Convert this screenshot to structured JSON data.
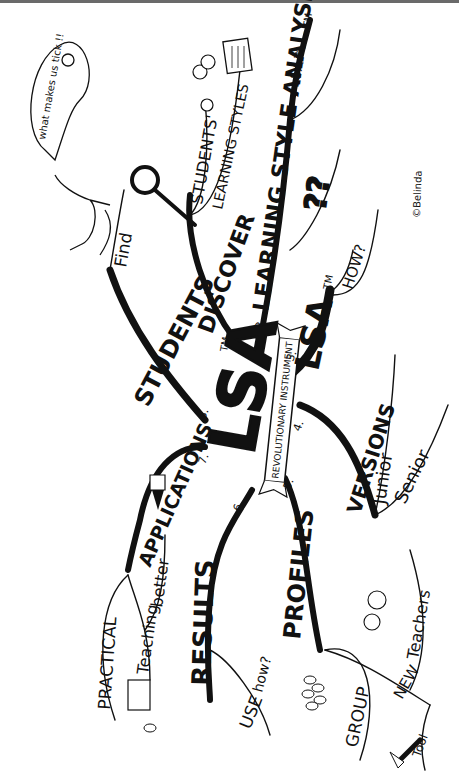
{
  "title": "LSA",
  "center": {
    "main_text": "LSA",
    "tm": "TM",
    "banner": "REVOLUTIONARY INSTRUMENT"
  },
  "branches": [
    {
      "number": "1.",
      "label": "DISCOVER",
      "children": [
        "STUDENTS'",
        "LEARNING STYLES"
      ]
    },
    {
      "number": "2.",
      "label": "LEARNING STYLE ANALYSIS",
      "tm": "TM",
      "children": [
        "LSA™",
        "??"
      ]
    },
    {
      "number": "3.",
      "label": "LSA",
      "tm": "TM",
      "children": [
        "HOW?"
      ]
    },
    {
      "number": "4.",
      "label": "VERSIONS",
      "children": [
        "Junior",
        "Senior"
      ]
    },
    {
      "number": "5.",
      "label": "PROFILES",
      "children": [
        "GROUP",
        "NEW",
        "Teachers",
        "Tool"
      ]
    },
    {
      "number": "6.",
      "label": "RESULTS",
      "children": [
        "USE",
        "how?"
      ]
    },
    {
      "number": "7.",
      "label": "APPLICATIONS",
      "children": [
        "PRACTICAL",
        "Teaching",
        "better"
      ]
    },
    {
      "number": "8.",
      "label": "STUDENTS",
      "children": [
        "Find",
        "what makes us tick !!"
      ]
    }
  ],
  "speech_bubble": "what makes us tick !!",
  "signature": "©Belinda",
  "colors": {
    "ink": "#111111",
    "paper": "#ffffff",
    "topbar": "#6a6a6a"
  },
  "icons": [
    "magnifier-icon",
    "stick-figure-icon",
    "faces-icon",
    "document-icon",
    "pencil-icon",
    "hammer-icon",
    "crowd-icon"
  ]
}
